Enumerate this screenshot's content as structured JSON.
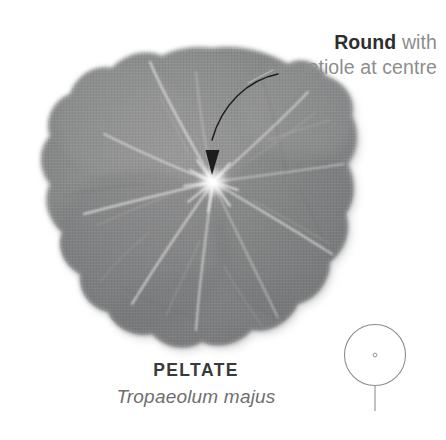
{
  "figure": {
    "annotation": {
      "line1_strong": "Round",
      "line1_light": " with",
      "line2": "petiole at centre"
    },
    "caption": {
      "leaf_shape_name": "PELTATE",
      "species_binomial": "Tropaeolum majus"
    },
    "schematic": {
      "name": "peltate-shape-diagram",
      "outline": "circle",
      "attachment_point": "centre-dot",
      "stem": "vertical-petiole"
    },
    "colors": {
      "background": "#ffffff",
      "leaf_body": "#8b8b8b",
      "leaf_body_dark": "#6f7172",
      "leaf_body_light": "#a2a2a2",
      "vein": "#d8d8d4",
      "vein_hub": "#ffffff",
      "arrow": "#1d1d1d",
      "leader_line": "#b5b5b5",
      "schematic_stroke": "#8a8a8a",
      "text_strong": "#2e2e2e",
      "text_light": "#8d8d8d",
      "caption_name": "#3a3a3a",
      "caption_species": "#6f6f6f"
    }
  }
}
